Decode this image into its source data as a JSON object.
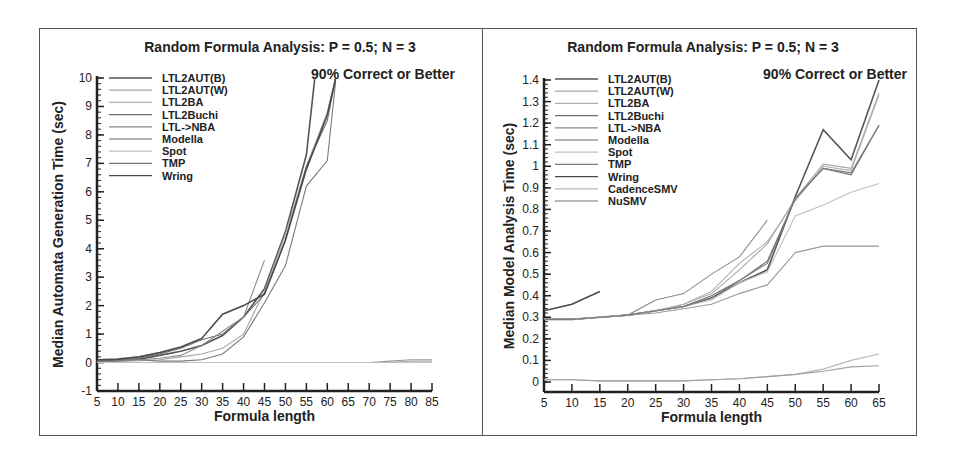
{
  "chart_data": [
    {
      "type": "line",
      "title": "Random Formula Analysis: P = 0.5; N = 3",
      "annotation": "90% Correct or Better",
      "xlabel": "Formula length",
      "ylabel": "Median Automata Generation Time (sec)",
      "xlim": [
        5,
        85
      ],
      "ylim": [
        -1,
        10
      ],
      "xticks": [
        5,
        10,
        15,
        20,
        25,
        30,
        35,
        40,
        45,
        50,
        55,
        60,
        65,
        70,
        75,
        80,
        85
      ],
      "yticks": [
        -1,
        0,
        1,
        2,
        3,
        4,
        5,
        6,
        7,
        8,
        9,
        10
      ],
      "grid": false,
      "legend_position": "upper-left",
      "series": [
        {
          "name": "LTL2AUT(B)",
          "x": [
            5,
            10,
            15,
            20,
            25,
            30,
            35,
            40,
            45,
            50,
            55,
            57
          ],
          "values": [
            0.05,
            0.08,
            0.12,
            0.25,
            0.4,
            0.6,
            0.95,
            1.6,
            2.6,
            4.6,
            7.3,
            10
          ]
        },
        {
          "name": "LTL2AUT(W)",
          "x": [
            5,
            10,
            15,
            20,
            25,
            30,
            35,
            40,
            45,
            50,
            55,
            60,
            62
          ],
          "values": [
            0.02,
            0.04,
            0.06,
            0.1,
            0.2,
            0.3,
            0.5,
            1.0,
            2.5,
            4.5,
            6.9,
            8.8,
            10
          ]
        },
        {
          "name": "LTL2BA",
          "x": [
            5,
            10,
            15,
            20,
            25,
            30,
            35,
            40,
            45,
            50,
            55,
            60,
            65,
            70,
            75,
            80,
            85
          ],
          "values": [
            0.0,
            0.0,
            0.0,
            0.0,
            0.0,
            0.0,
            0.0,
            0.0,
            0.0,
            0.0,
            0.0,
            0.0,
            0.0,
            0.0,
            0.0,
            0.05,
            0.05
          ]
        },
        {
          "name": "LTL2Buchi",
          "x": [
            5,
            10,
            15,
            20,
            25,
            30,
            35,
            40,
            45,
            50,
            55,
            60,
            62
          ],
          "values": [
            0.05,
            0.07,
            0.15,
            0.3,
            0.5,
            0.8,
            1.0,
            1.6,
            2.4,
            4.3,
            6.9,
            8.5,
            10
          ]
        },
        {
          "name": "LTL->NBA",
          "x": [
            5,
            10,
            15,
            20,
            25,
            30,
            35,
            40,
            45
          ],
          "values": [
            0.0,
            0.05,
            0.1,
            0.15,
            0.25,
            0.6,
            1.1,
            1.6,
            3.6
          ]
        },
        {
          "name": "Modella",
          "x": [
            5,
            10,
            15,
            20,
            25,
            30,
            35,
            40,
            45,
            50,
            55,
            60,
            65,
            70,
            75,
            80,
            85
          ],
          "values": [
            0.0,
            0.0,
            0.0,
            0.0,
            0.0,
            0.0,
            0.0,
            0.0,
            0.0,
            0.0,
            0.0,
            0.0,
            0.0,
            0.0,
            0.05,
            0.1,
            0.1
          ]
        },
        {
          "name": "Spot",
          "x": [
            5,
            10,
            15,
            20,
            25,
            30,
            35,
            40,
            45,
            50,
            55,
            60,
            65,
            70,
            75,
            80,
            85
          ],
          "values": [
            0.0,
            0.0,
            0.0,
            0.0,
            0.0,
            0.0,
            0.0,
            0.0,
            0.0,
            0.0,
            0.0,
            0.0,
            0.0,
            0.0,
            0.0,
            0.0,
            0.0
          ]
        },
        {
          "name": "TMP",
          "x": [
            5,
            10,
            15,
            20,
            25,
            30,
            35,
            40,
            45,
            50,
            55,
            60,
            62
          ],
          "values": [
            0.1,
            0.1,
            0.1,
            0.05,
            0.05,
            0.1,
            0.3,
            0.9,
            2.1,
            3.4,
            6.2,
            7.1,
            9.9
          ]
        },
        {
          "name": "Wring",
          "x": [
            5,
            10,
            15,
            20,
            25,
            30,
            35,
            40,
            45,
            50,
            55,
            60,
            62
          ],
          "values": [
            0.1,
            0.12,
            0.2,
            0.35,
            0.55,
            0.85,
            1.7,
            2.0,
            2.4,
            4.3,
            6.8,
            8.7,
            10
          ]
        }
      ]
    },
    {
      "type": "line",
      "title": "Random Formula Analysis: P = 0.5; N = 3",
      "annotation": "90% Correct or Better",
      "xlabel": "Formula length",
      "ylabel": "Median Model Analysis Time (sec)",
      "xlim": [
        5,
        65
      ],
      "ylim": [
        -0.05,
        1.4
      ],
      "xticks": [
        5,
        10,
        15,
        20,
        25,
        30,
        35,
        40,
        45,
        50,
        55,
        60,
        65
      ],
      "yticks": [
        0,
        0.1,
        0.2,
        0.3,
        0.4,
        0.5,
        0.6,
        0.7,
        0.8,
        0.9,
        1,
        1.1,
        1.2,
        1.3,
        1.4
      ],
      "grid": false,
      "legend_position": "upper-left",
      "series": [
        {
          "name": "LTL2AUT(B)",
          "x": [
            5,
            10,
            15,
            20,
            25,
            30,
            35,
            40,
            45,
            50,
            55,
            60,
            65
          ],
          "values": [
            0.29,
            0.29,
            0.3,
            0.31,
            0.33,
            0.35,
            0.39,
            0.46,
            0.52,
            0.86,
            1.17,
            1.03,
            1.4
          ]
        },
        {
          "name": "LTL2AUT(W)",
          "x": [
            5,
            10,
            15,
            20,
            25,
            30,
            35,
            40,
            45,
            50,
            55,
            60,
            65
          ],
          "values": [
            0.29,
            0.29,
            0.3,
            0.31,
            0.33,
            0.36,
            0.41,
            0.52,
            0.64,
            0.85,
            1.01,
            0.99,
            1.34
          ]
        },
        {
          "name": "LTL2BA",
          "x": [
            5,
            10,
            15,
            20,
            25,
            30,
            35,
            40,
            45,
            50,
            55,
            60,
            65
          ],
          "values": [
            0.29,
            0.29,
            0.3,
            0.31,
            0.33,
            0.36,
            0.42,
            0.55,
            0.65,
            0.84,
            1.0,
            0.98,
            1.33
          ]
        },
        {
          "name": "LTL2Buchi",
          "x": [
            5,
            10,
            15,
            20,
            25,
            30,
            35,
            40,
            45,
            50,
            55,
            60,
            65
          ],
          "values": [
            0.29,
            0.29,
            0.3,
            0.31,
            0.33,
            0.35,
            0.4,
            0.47,
            0.56,
            0.85,
            0.99,
            0.96,
            1.19
          ]
        },
        {
          "name": "LTL->NBA",
          "x": [
            5,
            10,
            15,
            20,
            25,
            30,
            35,
            40,
            45
          ],
          "values": [
            0.29,
            0.29,
            0.3,
            0.31,
            0.38,
            0.41,
            0.5,
            0.58,
            0.75
          ]
        },
        {
          "name": "Modella",
          "x": [
            5,
            10,
            15,
            20,
            25,
            30,
            35,
            40,
            45,
            50,
            55,
            60,
            65
          ],
          "values": [
            0.29,
            0.29,
            0.3,
            0.31,
            0.32,
            0.34,
            0.36,
            0.41,
            0.45,
            0.6,
            0.63,
            0.63,
            0.63
          ]
        },
        {
          "name": "Spot",
          "x": [
            5,
            10,
            15,
            20,
            25,
            30,
            35,
            40,
            45,
            50,
            55,
            60,
            65
          ],
          "values": [
            0.29,
            0.29,
            0.3,
            0.31,
            0.33,
            0.35,
            0.38,
            0.46,
            0.51,
            0.77,
            0.82,
            0.88,
            0.92
          ]
        },
        {
          "name": "TMP",
          "x": [
            5,
            10,
            15,
            20,
            25,
            30,
            35,
            40,
            45,
            50,
            55,
            60,
            65
          ],
          "values": [
            0.29,
            0.29,
            0.3,
            0.31,
            0.33,
            0.35,
            0.39,
            0.47,
            0.55,
            0.85,
            0.99,
            0.97,
            1.19
          ]
        },
        {
          "name": "Wring",
          "x": [
            5,
            10,
            15
          ],
          "values": [
            0.33,
            0.36,
            0.42
          ]
        },
        {
          "name": "CadenceSMV",
          "x": [
            5,
            10,
            15,
            20,
            25,
            30,
            35,
            40,
            45,
            50,
            55,
            60,
            65
          ],
          "values": [
            0.01,
            0.01,
            0.005,
            0.005,
            0.005,
            0.005,
            0.01,
            0.015,
            0.025,
            0.035,
            0.06,
            0.1,
            0.13
          ]
        },
        {
          "name": "NuSMV",
          "x": [
            5,
            10,
            15,
            20,
            25,
            30,
            35,
            40,
            45,
            50,
            55,
            60,
            65
          ],
          "values": [
            0.01,
            0.01,
            0.005,
            0.005,
            0.005,
            0.005,
            0.01,
            0.015,
            0.025,
            0.035,
            0.05,
            0.07,
            0.075
          ]
        }
      ]
    }
  ],
  "charts": {
    "left": {
      "title": "Random Formula Analysis: P = 0.5; N = 3",
      "annotation": "90% Correct or Better",
      "xlabel": "Formula length",
      "ylabel": "Median Automata Generation Time (sec)"
    },
    "right": {
      "title": "Random Formula Analysis: P = 0.5; N = 3",
      "annotation": "90% Correct or Better",
      "xlabel": "Formula length",
      "ylabel": "Median Model Analysis Time (sec)"
    }
  },
  "colors": {
    "LTL2AUT(B)": "#555555",
    "LTL2AUT(W)": "#a8a8a8",
    "LTL2BA": "#b0b0b0",
    "LTL2Buchi": "#707070",
    "LTL->NBA": "#8a8a8a",
    "Modella": "#9a9a9a",
    "Spot": "#c0c0c0",
    "TMP": "#7a7a7a",
    "Wring": "#4a4a4a",
    "CadenceSMV": "#b8b8b8",
    "NuSMV": "#a0a0a0"
  }
}
